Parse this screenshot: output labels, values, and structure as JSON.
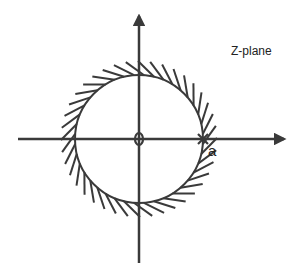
{
  "diagram": {
    "title": "Z-plane",
    "pole_label": "a",
    "zero_symbol": "0",
    "colors": {
      "stroke": "#3a3a3a",
      "text": "#222222",
      "background": "#ffffff"
    },
    "elements": {
      "unit_circle": {
        "cx": 139,
        "cy": 139,
        "r": 64,
        "hatching": "outside"
      },
      "zero": {
        "x": 139,
        "y": 139
      },
      "pole": {
        "x": 203,
        "y": 139
      }
    }
  }
}
